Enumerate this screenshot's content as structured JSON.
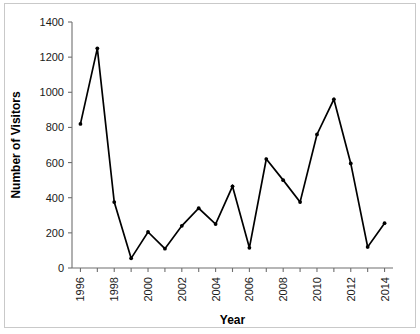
{
  "figure": {
    "background_color": "#ffffff",
    "frame_color": "#c9c9c9",
    "axis_color": "#6f6f6f",
    "series_color": "#000000"
  },
  "chart_data": {
    "type": "line",
    "title": "",
    "xlabel": "Year",
    "ylabel": "Number of Visitors",
    "xlim": [
      1995.5,
      2014.5
    ],
    "ylim": [
      0,
      1400
    ],
    "grid": false,
    "legend": null,
    "yticks": [
      0,
      200,
      400,
      600,
      800,
      1000,
      1200,
      1400
    ],
    "ytick_labels": [
      "0",
      "200",
      "400",
      "600",
      "800",
      "1000",
      "1200",
      "1400"
    ],
    "xticks": [
      1996,
      1997,
      1998,
      1999,
      2000,
      2001,
      2002,
      2003,
      2004,
      2005,
      2006,
      2007,
      2008,
      2009,
      2010,
      2011,
      2012,
      2013,
      2014
    ],
    "xtick_labels": [
      "1996",
      "",
      "1998",
      "",
      "2000",
      "",
      "2002",
      "",
      "2004",
      "",
      "2006",
      "",
      "2008",
      "",
      "2010",
      "",
      "2012",
      "",
      "2014"
    ],
    "xtick_label_rotation": 90,
    "markers": "filled-circle",
    "x": [
      1996,
      1997,
      1998,
      1999,
      2000,
      2001,
      2002,
      2003,
      2004,
      2005,
      2006,
      2007,
      2008,
      2009,
      2010,
      2011,
      2012,
      2013,
      2014
    ],
    "values": [
      820,
      1250,
      375,
      55,
      205,
      110,
      240,
      340,
      250,
      465,
      115,
      620,
      500,
      375,
      760,
      960,
      595,
      120,
      255
    ]
  }
}
